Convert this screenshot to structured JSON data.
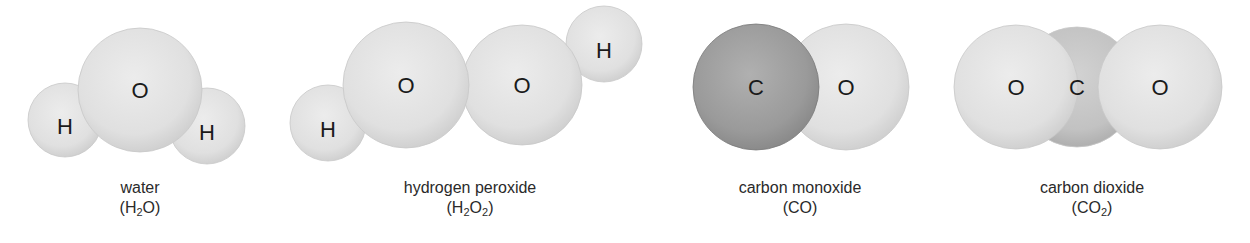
{
  "figure": {
    "molecules": [
      {
        "id": "water",
        "name": "water",
        "formula_parts": [
          "(H",
          "2",
          "O)"
        ],
        "atoms": [
          {
            "element": "H",
            "cx": 65,
            "cy": 120,
            "r": 37,
            "shade": "light"
          },
          {
            "element": "H",
            "cx": 207,
            "cy": 126,
            "r": 38,
            "shade": "light"
          },
          {
            "element": "O",
            "cx": 140,
            "cy": 90,
            "r": 62,
            "shade": "light"
          }
        ],
        "caption_x": 140
      },
      {
        "id": "hydrogen-peroxide",
        "name": "hydrogen peroxide",
        "formula_parts": [
          "(H",
          "2",
          "O",
          "2",
          ")"
        ],
        "atoms": [
          {
            "element": "H",
            "cx": 328,
            "cy": 123,
            "r": 38,
            "shade": "light"
          },
          {
            "element": "H",
            "cx": 604,
            "cy": 44,
            "r": 38,
            "shade": "light"
          },
          {
            "element": "O",
            "cx": 522,
            "cy": 85,
            "r": 60,
            "shade": "light"
          },
          {
            "element": "O",
            "cx": 406,
            "cy": 85,
            "r": 63,
            "shade": "light"
          }
        ],
        "caption_x": 470
      },
      {
        "id": "carbon-monoxide",
        "name": "carbon monoxide",
        "formula_parts": [
          "(CO)"
        ],
        "atoms": [
          {
            "element": "O",
            "cx": 846,
            "cy": 87,
            "r": 63,
            "shade": "light"
          },
          {
            "element": "C",
            "cx": 756,
            "cy": 87,
            "r": 63,
            "shade": "dark"
          }
        ],
        "caption_x": 800
      },
      {
        "id": "carbon-dioxide",
        "name": "carbon dioxide",
        "formula_parts": [
          "(CO",
          "2",
          ")"
        ],
        "atoms": [
          {
            "element": "C",
            "cx": 1077,
            "cy": 87,
            "r": 60,
            "shade": "medium"
          },
          {
            "element": "O",
            "cx": 1016,
            "cy": 87,
            "r": 62,
            "shade": "light"
          },
          {
            "element": "O",
            "cx": 1160,
            "cy": 87,
            "r": 62,
            "shade": "light"
          }
        ],
        "caption_x": 1092
      }
    ],
    "colors": {
      "light_atom": "#e4e4e4",
      "light_atom_edge": "#cfcfcf",
      "dark_atom": "#9a9a9a",
      "medium_atom": "#c4c4c4",
      "label_text": "#1a1a1a",
      "caption_text": "#2a2a2a",
      "background": "#ffffff"
    }
  }
}
